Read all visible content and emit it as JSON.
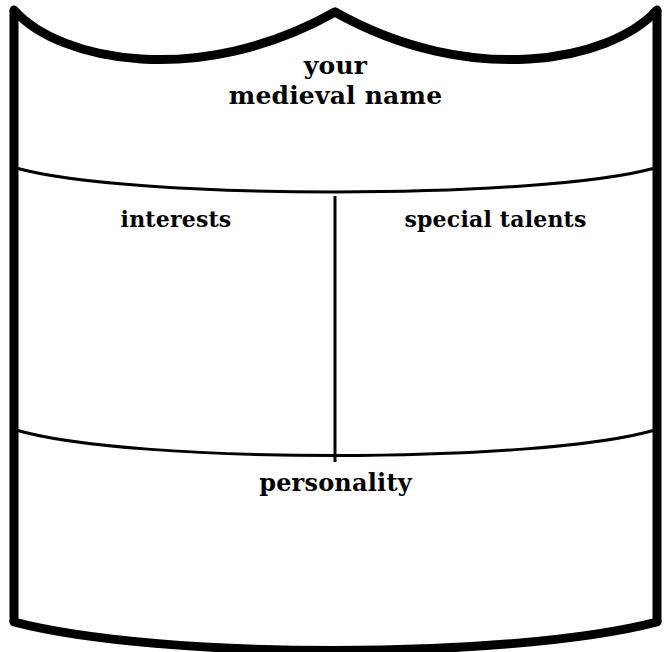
{
  "worksheet": {
    "name": "your medieval name shield",
    "background_color": "#ffffff",
    "ink_color": "#000000",
    "title": {
      "line_1": "your",
      "line_2": "medieval name"
    },
    "fields": [
      {
        "id": "interests",
        "label": "interests",
        "value": "",
        "placeholder": ""
      },
      {
        "id": "special-talents",
        "label": "special talents",
        "value": "",
        "placeholder": ""
      },
      {
        "id": "personality",
        "label": "personality",
        "value": "",
        "placeholder": ""
      }
    ]
  }
}
